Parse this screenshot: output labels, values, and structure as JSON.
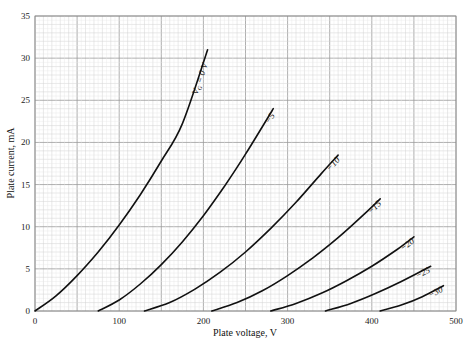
{
  "chart_data": {
    "type": "line",
    "title": "",
    "xlabel": "Plate voltage, V",
    "ylabel": "Plate current, mA",
    "xlim": [
      0,
      500
    ],
    "ylim": [
      0,
      35
    ],
    "xticks": [
      0,
      100,
      200,
      300,
      400,
      500
    ],
    "yticks": [
      0,
      5,
      10,
      15,
      20,
      25,
      30,
      35
    ],
    "grid": true,
    "legend": "inline curve labels",
    "series": [
      {
        "name": "V_G = 0 V",
        "label": "VG = 0 V",
        "x": [
          0,
          25,
          50,
          75,
          100,
          125,
          150,
          175,
          205
        ],
        "y": [
          0,
          1.8,
          4.2,
          7.0,
          10.2,
          13.8,
          17.8,
          22.2,
          31.0
        ]
      },
      {
        "name": "-5",
        "label": "−5",
        "x": [
          75,
          100,
          125,
          150,
          175,
          200,
          225,
          250,
          283
        ],
        "y": [
          0,
          1.3,
          3.2,
          5.5,
          8.2,
          11.3,
          14.8,
          18.6,
          24.0
        ]
      },
      {
        "name": "-10",
        "label": "−10",
        "x": [
          130,
          160,
          190,
          220,
          250,
          280,
          310,
          340,
          360
        ],
        "y": [
          0,
          1.0,
          2.6,
          4.6,
          7.0,
          9.8,
          12.9,
          16.3,
          18.5
        ]
      },
      {
        "name": "-15",
        "label": "−15",
        "x": [
          210,
          240,
          270,
          300,
          330,
          360,
          390,
          410
        ],
        "y": [
          0,
          1.0,
          2.4,
          4.2,
          6.3,
          8.7,
          11.4,
          13.3
        ]
      },
      {
        "name": "-20",
        "label": "−20",
        "x": [
          280,
          310,
          340,
          370,
          400,
          430,
          450
        ],
        "y": [
          0,
          0.9,
          2.1,
          3.6,
          5.3,
          7.3,
          8.8
        ]
      },
      {
        "name": "-25",
        "label": "−25",
        "x": [
          345,
          375,
          405,
          435,
          470
        ],
        "y": [
          0,
          0.9,
          2.1,
          3.5,
          5.3
        ]
      },
      {
        "name": "-30",
        "label": "−30",
        "x": [
          410,
          435,
          460,
          485
        ],
        "y": [
          0,
          0.7,
          1.7,
          3.0
        ]
      }
    ]
  },
  "axes": {
    "xlabel": "Plate voltage, V",
    "ylabel": "Plate current, mA"
  }
}
